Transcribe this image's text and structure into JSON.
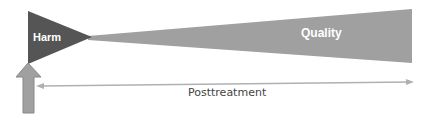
{
  "diagram": {
    "harm": {
      "label": "Harm",
      "color": "#555555"
    },
    "quality": {
      "label": "Quality",
      "color": "#a0a0a0"
    },
    "timeline": {
      "label": "Posttreatment",
      "line_color": "#b0b0b0"
    },
    "intervention_arrow": {
      "color": "#a0a0a0",
      "outline": "#888888"
    }
  }
}
